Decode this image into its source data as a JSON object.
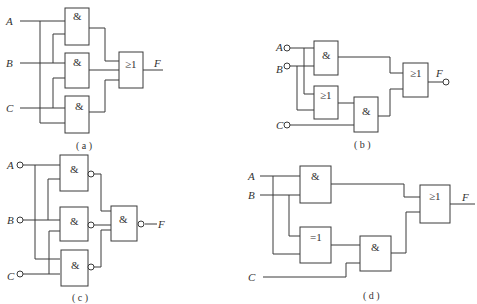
{
  "diagrams": {
    "a": {
      "caption": "( a )",
      "inputs": [
        "A",
        "B",
        "C"
      ],
      "output": "F",
      "gates": [
        {
          "id": "a1",
          "symbol": "&",
          "type": "AND",
          "inputs": [
            "A",
            "B"
          ]
        },
        {
          "id": "a2",
          "symbol": "&",
          "type": "AND",
          "inputs": [
            "B",
            "C"
          ]
        },
        {
          "id": "a3",
          "symbol": "&",
          "type": "AND",
          "inputs": [
            "C",
            "A"
          ]
        },
        {
          "id": "a4",
          "symbol": "≥1",
          "type": "OR",
          "inputs": [
            "a1",
            "a2",
            "a3"
          ],
          "output": "F"
        }
      ]
    },
    "b": {
      "caption": "( b )",
      "inputs": [
        "A",
        "B",
        "C"
      ],
      "output": "F",
      "gates": [
        {
          "id": "b1",
          "symbol": "&",
          "type": "AND",
          "inputs": [
            "A",
            "B"
          ]
        },
        {
          "id": "b2",
          "symbol": "≥1",
          "type": "OR",
          "inputs": [
            "A",
            "B"
          ]
        },
        {
          "id": "b3",
          "symbol": "&",
          "type": "AND",
          "inputs": [
            "b2",
            "C"
          ]
        },
        {
          "id": "b4",
          "symbol": "≥1",
          "type": "OR",
          "inputs": [
            "b1",
            "b3"
          ],
          "output": "F"
        }
      ]
    },
    "c": {
      "caption": "( c )",
      "inputs": [
        "A",
        "B",
        "C"
      ],
      "output": "F",
      "gates": [
        {
          "id": "c1",
          "symbol": "&",
          "type": "NAND",
          "inputs": [
            "A",
            "B"
          ]
        },
        {
          "id": "c2",
          "symbol": "&",
          "type": "NAND",
          "inputs": [
            "B",
            "C"
          ]
        },
        {
          "id": "c3",
          "symbol": "&",
          "type": "NAND",
          "inputs": [
            "A",
            "C"
          ]
        },
        {
          "id": "c4",
          "symbol": "&",
          "type": "NAND",
          "inputs": [
            "c1",
            "c2",
            "c3"
          ],
          "output": "F"
        }
      ]
    },
    "d": {
      "caption": "( d )",
      "inputs": [
        "A",
        "B",
        "C"
      ],
      "output": "F",
      "gates": [
        {
          "id": "d1",
          "symbol": "&",
          "type": "AND",
          "inputs": [
            "A",
            "B"
          ]
        },
        {
          "id": "d2",
          "symbol": "=1",
          "type": "XOR",
          "inputs": [
            "B",
            "A"
          ]
        },
        {
          "id": "d3",
          "symbol": "&",
          "type": "AND",
          "inputs": [
            "d2",
            "C"
          ]
        },
        {
          "id": "d4",
          "symbol": "≥1",
          "type": "OR",
          "inputs": [
            "d1",
            "d3"
          ],
          "output": "F"
        }
      ]
    }
  }
}
